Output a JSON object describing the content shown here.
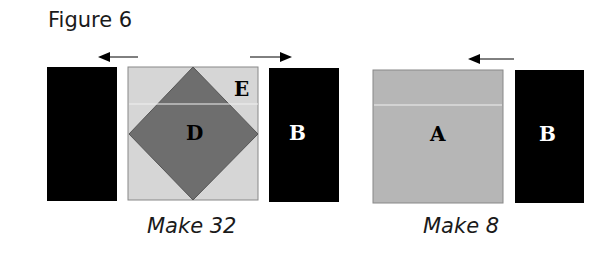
{
  "figure": {
    "title": "Figure 6",
    "units": [
      {
        "caption": "Make 32",
        "pieces": [
          {
            "name": "B-left",
            "label": "",
            "color": "#000000"
          },
          {
            "name": "D-E-block",
            "diamond_label": "D",
            "corner_label": "E",
            "diamond_color": "#6e6e6e",
            "background_color": "#d4d4d4"
          },
          {
            "name": "B-right",
            "label": "B",
            "color": "#000000"
          }
        ],
        "arrows": [
          "left",
          "right"
        ]
      },
      {
        "caption": "Make 8",
        "pieces": [
          {
            "name": "A",
            "label": "A",
            "color": "#b4b4b4"
          },
          {
            "name": "B",
            "label": "B",
            "color": "#000000"
          }
        ],
        "arrows": [
          "left"
        ]
      }
    ]
  }
}
